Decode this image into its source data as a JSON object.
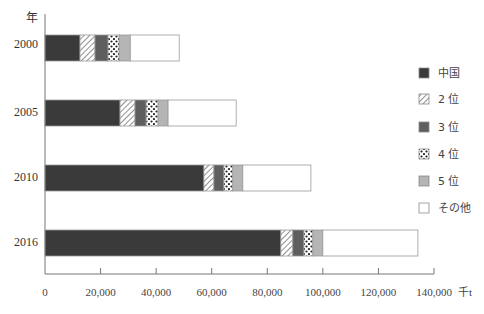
{
  "chart_data": {
    "type": "bar",
    "orientation": "horizontal",
    "stacked": true,
    "title": "",
    "xlabel": "千t",
    "ylabel": "年",
    "xlim": [
      0,
      140000
    ],
    "x_ticks": [
      0,
      20000,
      40000,
      60000,
      80000,
      100000,
      120000,
      140000
    ],
    "x_tick_labels": [
      "0",
      "20,000",
      "40,000",
      "60,000",
      "80,000",
      "100,000",
      "120,000",
      "140,000"
    ],
    "categories": [
      "2000",
      "2005",
      "2010",
      "2016"
    ],
    "series": [
      {
        "name": "中国",
        "pattern": "solid-dark",
        "color": "#3a3a3a",
        "values": [
          12600,
          27000,
          57200,
          84900
        ]
      },
      {
        "name": "2 位",
        "pattern": "diagonal-hatch",
        "color": "#ffffff",
        "values": [
          5400,
          5400,
          3600,
          4300
        ]
      },
      {
        "name": "3 位",
        "pattern": "solid-medium",
        "color": "#5e5e5e",
        "values": [
          4700,
          4000,
          3600,
          4000
        ]
      },
      {
        "name": "4 位",
        "pattern": "dots",
        "color": "#ffffff",
        "values": [
          4000,
          4300,
          3200,
          3200
        ]
      },
      {
        "name": "5 位",
        "pattern": "solid-light",
        "color": "#b5b5b5",
        "values": [
          4000,
          3600,
          3600,
          3600
        ]
      },
      {
        "name": "その他",
        "pattern": "white",
        "color": "#ffffff",
        "values": [
          17600,
          24500,
          24500,
          34200
        ]
      }
    ],
    "totals": [
      48300,
      68800,
      95700,
      134200
    ],
    "legend_position": "right",
    "grid": false
  },
  "axis": {
    "y_unit": "年",
    "x_unit": "千t"
  }
}
